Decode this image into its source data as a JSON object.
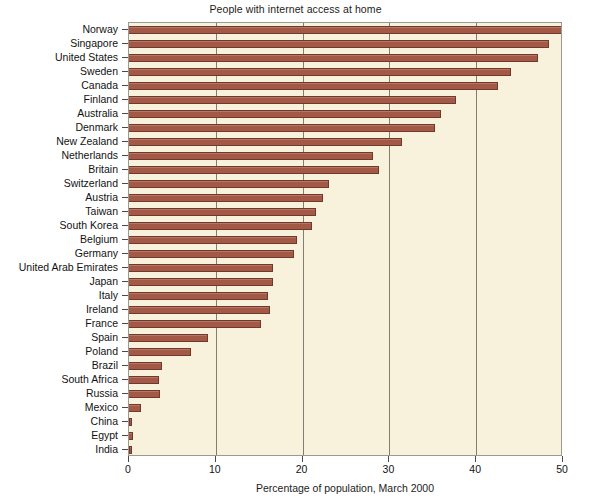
{
  "chart_data": {
    "type": "bar",
    "orientation": "horizontal",
    "title": "People with internet access at home",
    "xlabel": "Percentage of population, March 2000",
    "ylabel": "",
    "xlim": [
      0,
      50
    ],
    "xticks": [
      0,
      10,
      20,
      30,
      40,
      50
    ],
    "xtick_labels": [
      "0",
      "10",
      "20",
      "30",
      "40",
      "50"
    ],
    "grid": "vertical",
    "legend": "none",
    "bar_color": "#A35946",
    "bar_edge_color": "#6F3A2C",
    "plot_background": "#F8F2DD",
    "categories": [
      "Norway",
      "Singapore",
      "United States",
      "Sweden",
      "Canada",
      "Finland",
      "Australia",
      "Denmark",
      "New Zealand",
      "Netherlands",
      "Britain",
      "Switzerland",
      "Austria",
      "Taiwan",
      "South Korea",
      "Belgium",
      "Germany",
      "United Arab Emirates",
      "Japan",
      "Italy",
      "Ireland",
      "France",
      "Spain",
      "Poland",
      "Brazil",
      "South Africa",
      "Russia",
      "Mexico",
      "China",
      "Egypt",
      "India"
    ],
    "values": [
      49.9,
      48.4,
      47.1,
      44.0,
      42.5,
      37.7,
      36.0,
      35.2,
      31.4,
      28.1,
      28.8,
      23.0,
      22.4,
      21.6,
      21.1,
      19.4,
      19.0,
      16.6,
      16.6,
      16.0,
      16.3,
      15.2,
      9.1,
      7.1,
      3.8,
      3.5,
      3.6,
      1.4,
      0.4,
      0.5,
      0.3
    ]
  }
}
